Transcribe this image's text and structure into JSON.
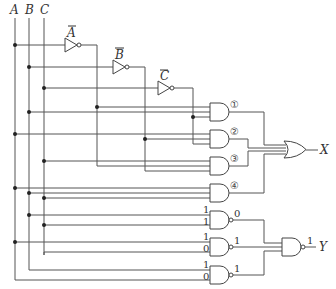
{
  "diagram": {
    "type": "logic-circuit",
    "inputs": [
      {
        "name": "A",
        "x": 15
      },
      {
        "name": "B",
        "x": 29
      },
      {
        "name": "C",
        "x": 44
      }
    ],
    "not_gates": [
      {
        "label": "A",
        "overbar": true
      },
      {
        "label": "B",
        "overbar": true
      },
      {
        "label": "C",
        "overbar": true
      }
    ],
    "and_gates": [
      {
        "id": "1",
        "marker": "①"
      },
      {
        "id": "2",
        "marker": "②"
      },
      {
        "id": "3",
        "marker": "③"
      },
      {
        "id": "4",
        "marker": "④"
      }
    ],
    "or_gate": {
      "output": "X"
    },
    "nand_gates": [
      {
        "inputs": [
          "1",
          "1"
        ],
        "output": "0"
      },
      {
        "inputs": [
          "1",
          "0"
        ],
        "output": "1"
      },
      {
        "inputs": [
          "1",
          "0"
        ],
        "output": "1"
      }
    ],
    "final_nand": {
      "output_value": "1",
      "output": "Y"
    }
  }
}
